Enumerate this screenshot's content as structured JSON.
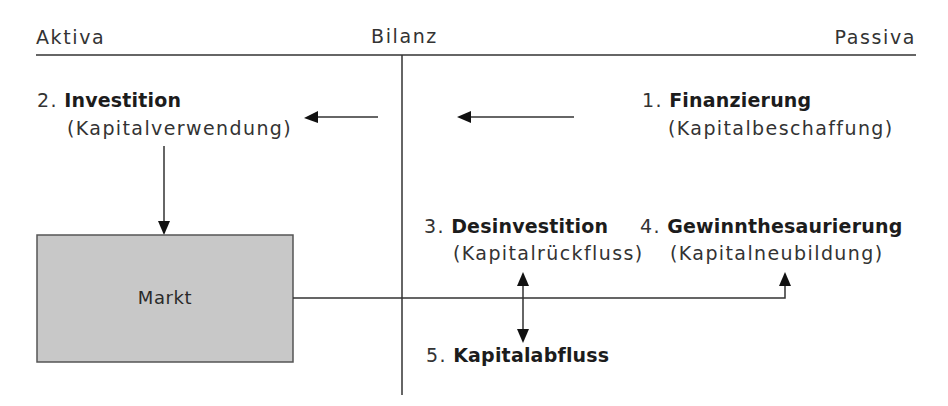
{
  "header": {
    "left": "Aktiva",
    "center": "Bilanz",
    "right": "Passiva"
  },
  "nodes": [
    {
      "number": "1.",
      "title": "Finanzierung",
      "subtitle": "(Kapitalbeschaffung)"
    },
    {
      "number": "2.",
      "title": "Investition",
      "subtitle": "(Kapitalverwendung)"
    },
    {
      "number": "3.",
      "title": "Desinvestition",
      "subtitle": "(Kapitalrückfluss)"
    },
    {
      "number": "4.",
      "title": "Gewinnthesaurierung",
      "subtitle": "(Kapitalneubildung)"
    },
    {
      "number": "5.",
      "title": "Kapitalabfluss"
    }
  ],
  "market": {
    "label": "Markt"
  },
  "colors": {
    "line": "#333333",
    "market_fill": "#c8c8c8",
    "market_border": "#555555",
    "text": "#222222"
  }
}
